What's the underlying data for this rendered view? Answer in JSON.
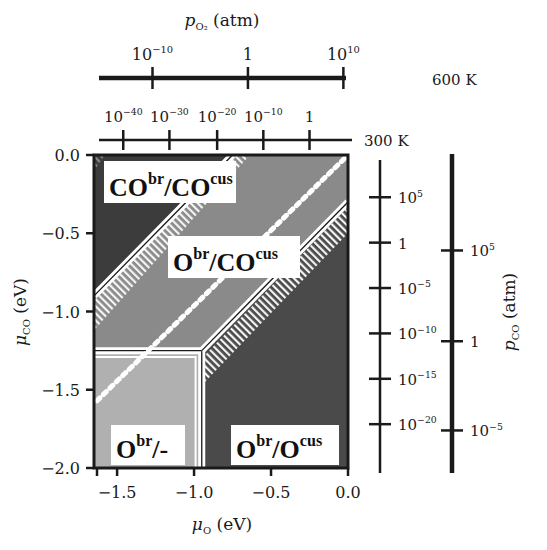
{
  "chart_data": {
    "type": "heatmap",
    "xlabel": "μO (eV)",
    "ylabel": "μCO (eV)",
    "xlim": [
      -1.65,
      0.0
    ],
    "ylim": [
      -2.0,
      0.0
    ],
    "x_ticks": [
      -1.5,
      -1.0,
      -0.5,
      0.0
    ],
    "x_tick_labels": [
      "−1.5",
      "−1.0",
      "−0.5",
      "0.0"
    ],
    "y_ticks": [
      0.0,
      -0.5,
      -1.0,
      -1.5,
      -2.0
    ],
    "y_tick_labels": [
      "0.0",
      "−0.5",
      "−1.0",
      "−1.5",
      "−2.0"
    ],
    "grid": false,
    "regions": [
      {
        "label": "CObr/COcus",
        "base": "CO",
        "sup1": "br",
        "sep": "/",
        "base2": "CO",
        "sup2": "cus",
        "color": "#3c3c3c"
      },
      {
        "label": "Obr/COcus",
        "base": "O",
        "sup1": "br",
        "sep": "/",
        "base2": "CO",
        "sup2": "cus",
        "color": "#8a8a8a"
      },
      {
        "label": "Obr/-",
        "base": "O",
        "sup1": "br",
        "sep": "/-",
        "base2": "",
        "sup2": "",
        "color": "#b0b0b0"
      },
      {
        "label": "Obr/Ocus",
        "base": "O",
        "sup1": "br",
        "sep": "/",
        "base2": "O",
        "sup2": "cus",
        "color": "#4a4a4a"
      }
    ],
    "boundaries": [
      {
        "name": "COcus-COcus/Obr-COcus",
        "points": [
          [
            -1.65,
            -0.9
          ],
          [
            -1.05,
            -0.3
          ],
          [
            -0.75,
            0.0
          ]
        ]
      },
      {
        "name": "Obr-COcus/Obr-Ocus",
        "points": [
          [
            -0.95,
            -1.25
          ],
          [
            0.0,
            -0.3
          ]
        ]
      },
      {
        "name": "horizontal Obr/-",
        "points": [
          [
            -1.65,
            -1.25
          ],
          [
            -0.95,
            -1.25
          ]
        ]
      },
      {
        "name": "vertical Obr/-",
        "points": [
          [
            -0.95,
            -1.25
          ],
          [
            -0.95,
            -2.0
          ]
        ]
      }
    ],
    "dotted_line": {
      "name": "thermodynamic-equilibrium",
      "points": [
        [
          -1.63,
          -1.57
        ],
        [
          0.0,
          0.0
        ]
      ]
    },
    "top_axes": [
      {
        "label": "pO2 (atm)",
        "temperature": "600 K",
        "ticks": [
          {
            "label": "10",
            "exp": "−10",
            "mu": -1.27
          },
          {
            "label": "1",
            "exp": "",
            "mu": -0.65
          },
          {
            "label": "10",
            "exp": "10",
            "mu": -0.03
          }
        ]
      },
      {
        "temperature": "300 K",
        "ticks": [
          {
            "label": "10",
            "exp": "−40",
            "mu": -1.46
          },
          {
            "label": "10",
            "exp": "−30",
            "mu": -1.16
          },
          {
            "label": "10",
            "exp": "−20",
            "mu": -0.85
          },
          {
            "label": "10",
            "exp": "−10",
            "mu": -0.55
          },
          {
            "label": "1",
            "exp": "",
            "mu": -0.25
          }
        ]
      }
    ],
    "right_axes": [
      {
        "temperature": "300 K",
        "ticks": [
          {
            "label": "10",
            "exp": "5",
            "mu": -0.27
          },
          {
            "label": "1",
            "exp": "",
            "mu": -0.56
          },
          {
            "label": "10",
            "exp": "−5",
            "mu": -0.85
          },
          {
            "label": "10",
            "exp": "−10",
            "mu": -1.14
          },
          {
            "label": "10",
            "exp": "−15",
            "mu": -1.43
          },
          {
            "label": "10",
            "exp": "−20",
            "mu": -1.72
          }
        ]
      },
      {
        "label": "pCO (atm)",
        "temperature": "600 K",
        "ticks": [
          {
            "label": "10",
            "exp": "5",
            "mu": -0.61
          },
          {
            "label": "1",
            "exp": "",
            "mu": -1.19
          },
          {
            "label": "10",
            "exp": "−5",
            "mu": -1.76
          }
        ]
      }
    ]
  },
  "labels": {
    "top_title_p": "p",
    "top_title_sub": "O₂",
    "top_title_unit": " (atm)",
    "temp_600": "600 K",
    "temp_300": "300 K",
    "right_title_p": "p",
    "right_title_sub": "CO",
    "right_title_unit": " (atm)",
    "xlabel_mu": "μ",
    "xlabel_sub": "O",
    "xlabel_unit": " (eV)",
    "ylabel_mu": "μ",
    "ylabel_sub": "CO",
    "ylabel_unit": " (eV)"
  }
}
